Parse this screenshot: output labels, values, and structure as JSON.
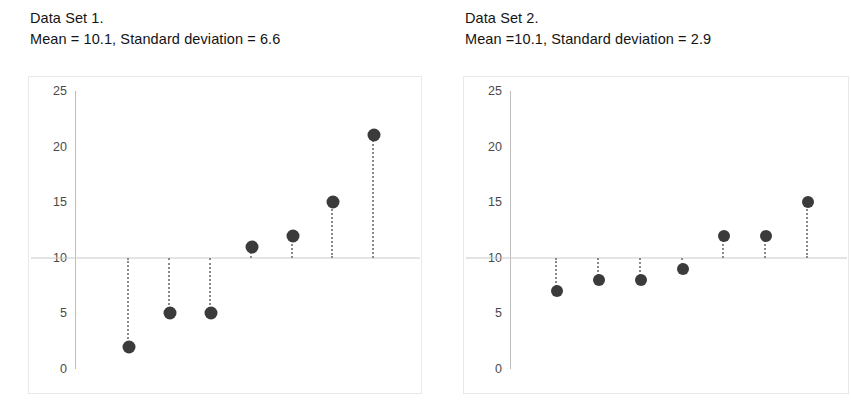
{
  "chart_data": [
    {
      "type": "scatter",
      "panel": "left",
      "title": "Data Set 1.",
      "subtitle": "Mean = 10.1, Standard deviation = 6.6",
      "mean": 10.1,
      "std": 6.6,
      "x": [
        1,
        2,
        3,
        4,
        5,
        6,
        7
      ],
      "values": [
        2,
        5,
        5,
        11,
        12,
        15,
        21
      ],
      "reference_line": 10,
      "ylim": [
        0,
        25
      ],
      "yticks": [
        0,
        5,
        10,
        15,
        20,
        25
      ],
      "ylabel": "",
      "xlabel": "",
      "grid": false,
      "legend": "none",
      "marker_color": "#3b3b3b",
      "stem_color": "#8a8a8a",
      "reference_line_color": "#c9c9c9"
    },
    {
      "type": "scatter",
      "panel": "right",
      "title": "Data Set 2.",
      "subtitle": "Mean =10.1, Standard deviation = 2.9",
      "mean": 10.1,
      "std": 2.9,
      "x": [
        1,
        2,
        3,
        4,
        5,
        6,
        7
      ],
      "values": [
        7,
        8,
        8,
        9,
        12,
        12,
        15
      ],
      "reference_line": 10,
      "ylim": [
        0,
        25
      ],
      "yticks": [
        0,
        5,
        10,
        15,
        20,
        25
      ],
      "ylabel": "",
      "xlabel": "",
      "grid": false,
      "legend": "none",
      "marker_color": "#3b3b3b",
      "stem_color": "#8a8a8a",
      "reference_line_color": "#c9c9c9"
    }
  ],
  "panels": {
    "left": {
      "caption_line1": "Data Set 1.",
      "caption_line2": "Mean = 10.1, Standard deviation = 6.6",
      "ytick_labels": [
        "25",
        "20",
        "15",
        "10",
        "5",
        "0"
      ]
    },
    "right": {
      "caption_line1": "Data Set 2.",
      "caption_line2": "Mean =10.1, Standard deviation = 2.9",
      "ytick_labels": [
        "25",
        "20",
        "15",
        "10",
        "5",
        "0"
      ]
    }
  }
}
